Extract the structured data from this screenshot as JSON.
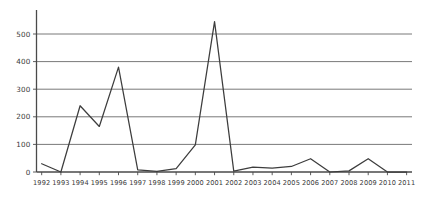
{
  "chart_data": {
    "type": "line",
    "title": "",
    "subtitle": "",
    "xlabel": "",
    "ylabel": "",
    "categories": [
      "1992",
      "1993",
      "1994",
      "1995",
      "1996",
      "1997",
      "1998",
      "1999",
      "2000",
      "2001",
      "2002",
      "2003",
      "2004",
      "2005",
      "2006",
      "2007",
      "2008",
      "2009",
      "2010",
      "2011"
    ],
    "values": [
      30,
      0,
      240,
      165,
      380,
      8,
      2,
      12,
      98,
      545,
      3,
      18,
      14,
      20,
      48,
      0,
      4,
      48,
      0,
      0
    ],
    "series": [
      {
        "name": "series-1",
        "values": [
          30,
          0,
          240,
          165,
          380,
          8,
          2,
          12,
          98,
          545,
          3,
          18,
          14,
          20,
          48,
          0,
          4,
          48,
          0,
          0
        ]
      }
    ],
    "ylim": [
      0,
      560
    ],
    "yticks": [
      0,
      100,
      200,
      300,
      400,
      500
    ],
    "ytick_labels": [
      "0",
      "100",
      "200",
      "300",
      "400",
      "500"
    ],
    "xtick_labels": [
      "1992",
      "1993",
      "1994",
      "1995",
      "1996",
      "1997",
      "1998",
      "1999",
      "2000",
      "2001",
      "2002",
      "2003",
      "2004",
      "2005",
      "2006",
      "2007",
      "2008",
      "2009",
      "2010",
      "2011"
    ],
    "grid": true,
    "grid_axis": "y",
    "legend": false,
    "legend_position": "none",
    "annotations": [],
    "line_color": "#3d3d3d",
    "grid_color": "#6a6a6a",
    "axis_color": "#4a4a4a",
    "background_color": "#ffffff"
  }
}
